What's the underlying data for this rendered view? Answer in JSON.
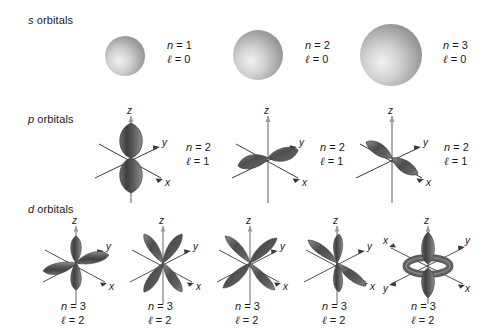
{
  "figure": {
    "background_color": "#ffffff",
    "width": 495,
    "height": 335
  },
  "rows": [
    {
      "id": "s",
      "label_italic": "s",
      "label_text": " orbitals",
      "label_x": 28,
      "label_y": 14,
      "orbital_type": "sphere"
    },
    {
      "id": "p",
      "label_italic": "p",
      "label_text": " orbitals",
      "label_x": 28,
      "label_y": 113,
      "orbital_type": "dumbbell"
    },
    {
      "id": "d",
      "label_italic": "d",
      "label_text": " orbitals",
      "label_x": 28,
      "label_y": 203,
      "orbital_type": "cloverleaf"
    }
  ],
  "s_orbitals": [
    {
      "name": "1s",
      "radius": 20,
      "center_x": 125,
      "center_y": 56,
      "n_label": "n",
      "n_eq": " = 1",
      "l_label": "ℓ",
      "l_eq": " = 0",
      "label_x": 167,
      "label_y": 39
    },
    {
      "name": "2s",
      "radius": 25,
      "center_x": 258,
      "center_y": 55,
      "n_label": "n",
      "n_eq": " = 2",
      "l_label": "ℓ",
      "l_eq": " = 0",
      "label_x": 305,
      "label_y": 39
    },
    {
      "name": "3s",
      "radius": 31,
      "center_x": 391,
      "center_y": 55,
      "n_label": "n",
      "n_eq": " = 3",
      "l_label": "ℓ",
      "l_eq": " = 0",
      "label_x": 443,
      "label_y": 39
    }
  ],
  "p_orbitals": [
    {
      "name": "2pz",
      "axis": "z",
      "center_x": 131,
      "center_y": 158,
      "n_label": "n",
      "n_eq": " = 2",
      "l_label": "ℓ",
      "l_eq": " = 1",
      "label_x": 186,
      "label_y": 141
    },
    {
      "name": "2py",
      "axis": "y",
      "center_x": 268,
      "center_y": 158,
      "n_label": "n",
      "n_eq": " = 2",
      "l_label": "ℓ",
      "l_eq": " = 1",
      "label_x": 320,
      "label_y": 141
    },
    {
      "name": "2px",
      "axis": "x",
      "center_x": 392,
      "center_y": 158,
      "n_label": "n",
      "n_eq": " = 2",
      "l_label": "ℓ",
      "l_eq": " = 1",
      "label_x": 444,
      "label_y": 141
    }
  ],
  "d_orbitals": [
    {
      "name": "3dxy",
      "shape": "cloverleaf",
      "rotation": 0,
      "center_x": 76,
      "center_y": 263,
      "n_label": "n",
      "n_eq": " = 3",
      "l_label": "ℓ",
      "l_eq": " = 2",
      "label_x": 61,
      "label_y": 300
    },
    {
      "name": "3dxz",
      "shape": "cloverleaf",
      "rotation": 0,
      "center_x": 163,
      "center_y": 263,
      "n_label": "n",
      "n_eq": " = 3",
      "l_label": "ℓ",
      "l_eq": " = 2",
      "label_x": 148,
      "label_y": 300
    },
    {
      "name": "3dyz",
      "shape": "cloverleaf",
      "rotation": 0,
      "center_x": 250,
      "center_y": 263,
      "n_label": "n",
      "n_eq": " = 3",
      "l_label": "ℓ",
      "l_eq": " = 2",
      "label_x": 235,
      "label_y": 300
    },
    {
      "name": "3dx2y2",
      "shape": "cloverleaf",
      "rotation": 0,
      "center_x": 337,
      "center_y": 263,
      "n_label": "n",
      "n_eq": " = 3",
      "l_label": "ℓ",
      "l_eq": " = 2",
      "label_x": 322,
      "label_y": 300
    },
    {
      "name": "3dz2",
      "shape": "dz2",
      "rotation": 0,
      "center_x": 428,
      "center_y": 263,
      "n_label": "n",
      "n_eq": " = 3",
      "l_label": "ℓ",
      "l_eq": " = 2",
      "label_x": 411,
      "label_y": 300
    }
  ],
  "axis_labels": {
    "x": "x",
    "y": "y",
    "z": "z"
  },
  "colors": {
    "lobe_dark": "#4a4a4a",
    "lobe_mid": "#767676",
    "lobe_light": "#a8a8a8",
    "sphere_light": "#e8e8e8",
    "sphere_dark": "#8f8f8f",
    "axis": "#3a3a3a",
    "axis_vertical": "#9a9a9a",
    "text": "#1a1a1a"
  }
}
